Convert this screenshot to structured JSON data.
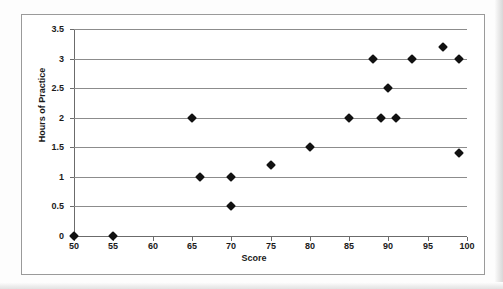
{
  "chart_data": {
    "type": "scatter",
    "title": "",
    "xlabel": "Score",
    "ylabel": "Hours of Practice",
    "xlim": [
      50,
      100
    ],
    "ylim": [
      0,
      3.5
    ],
    "xticks": [
      50,
      55,
      60,
      65,
      70,
      75,
      80,
      85,
      90,
      95,
      100
    ],
    "yticks": [
      0,
      0.5,
      1,
      1.5,
      2,
      2.5,
      3,
      3.5
    ],
    "xtick_labels": [
      "50",
      "55",
      "60",
      "65",
      "70",
      "75",
      "80",
      "85",
      "90",
      "95",
      "100"
    ],
    "ytick_labels": [
      "0",
      "0.5",
      "1",
      "1.5",
      "2",
      "2.5",
      "3",
      "3.5"
    ],
    "grid": "horizontal",
    "legend": "none",
    "marker_shape": "diamond",
    "marker_color": "#111111",
    "points": [
      {
        "x": 50,
        "y": 0
      },
      {
        "x": 55,
        "y": 0
      },
      {
        "x": 65,
        "y": 2
      },
      {
        "x": 66,
        "y": 1
      },
      {
        "x": 70,
        "y": 1
      },
      {
        "x": 70,
        "y": 0.5
      },
      {
        "x": 75,
        "y": 1.2
      },
      {
        "x": 80,
        "y": 1.5
      },
      {
        "x": 85,
        "y": 2
      },
      {
        "x": 88,
        "y": 3
      },
      {
        "x": 89,
        "y": 2
      },
      {
        "x": 90,
        "y": 2.5
      },
      {
        "x": 91,
        "y": 2
      },
      {
        "x": 93,
        "y": 3
      },
      {
        "x": 97,
        "y": 3.2
      },
      {
        "x": 99,
        "y": 3
      },
      {
        "x": 99,
        "y": 1.4
      }
    ]
  },
  "colors": {
    "gridline": "#8c8c8c",
    "axis": "#6b6b6b",
    "frame": "#9a9a9a",
    "marker": "#111111",
    "text": "#1a1a1a",
    "plot_background": "#ffffff",
    "page_background": "#fdfdfd"
  }
}
